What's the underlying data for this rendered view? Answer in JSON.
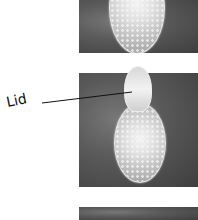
{
  "figure": {
    "panels": [
      {
        "id": "panel-1",
        "content": "egg-closed"
      },
      {
        "id": "panel-2",
        "content": "egg-lid-open"
      },
      {
        "id": "panel-3",
        "content": "partial"
      }
    ],
    "annotation": {
      "label": "Lid"
    }
  }
}
